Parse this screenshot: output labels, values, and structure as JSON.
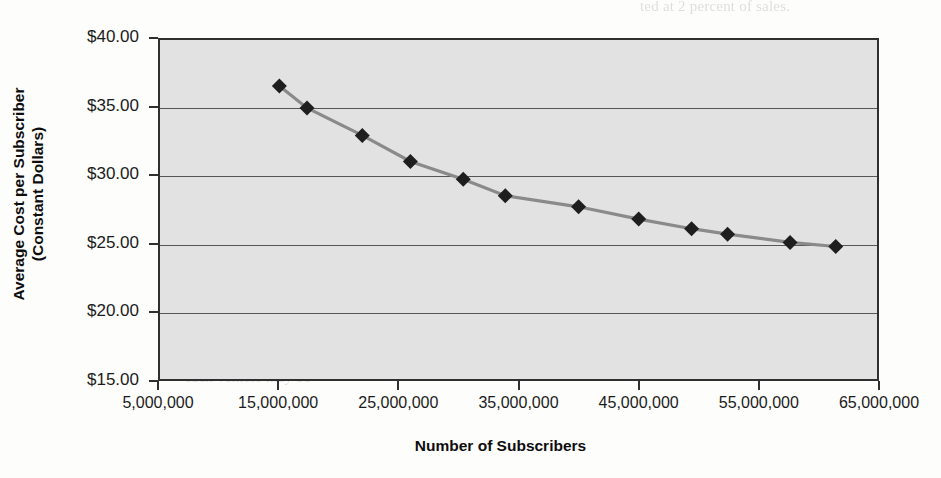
{
  "chart_data": {
    "type": "line",
    "title": "",
    "xlabel": "Number of Subscribers",
    "ylabel": "Average Cost per Subscriber (Constant Dollars)",
    "ylabel_line1": "Average Cost per Subscriber",
    "ylabel_line2": "(Constant Dollars)",
    "xlim": [
      5000000,
      65000000
    ],
    "ylim": [
      15,
      40
    ],
    "grid": true,
    "legend": "none",
    "marker": "diamond",
    "line_color": "#8a8a8a",
    "marker_color": "#1e1e1e",
    "plot_background": "#e2e2e2",
    "ytick_labels": [
      "$40.00",
      "$35.00",
      "$30.00",
      "$25.00",
      "$20.00",
      "$15.00"
    ],
    "ytick_values": [
      40,
      35,
      30,
      25,
      20,
      15
    ],
    "xtick_labels": [
      "5,000,000",
      "15,000,000",
      "25,000,000",
      "35,000,000",
      "45,000,000",
      "55,000,000",
      "65,000,000"
    ],
    "xtick_values": [
      5000000,
      15000000,
      25000000,
      35000000,
      45000000,
      55000000,
      65000000
    ],
    "x": [
      15100000,
      17400000,
      22000000,
      26000000,
      30400000,
      33900000,
      40000000,
      45000000,
      49400000,
      52400000,
      57600000,
      61400000
    ],
    "y": [
      36.5,
      34.9,
      32.9,
      31.0,
      29.7,
      28.5,
      27.7,
      26.8,
      26.1,
      25.7,
      25.1,
      24.8
    ],
    "series": [
      {
        "name": "Average Cost per Subscriber",
        "points": [
          {
            "x": 15100000,
            "y": 36.5
          },
          {
            "x": 17400000,
            "y": 34.9
          },
          {
            "x": 22000000,
            "y": 32.9
          },
          {
            "x": 26000000,
            "y": 31.0
          },
          {
            "x": 30400000,
            "y": 29.7
          },
          {
            "x": 33900000,
            "y": 28.5
          },
          {
            "x": 40000000,
            "y": 27.7
          },
          {
            "x": 45000000,
            "y": 26.8
          },
          {
            "x": 49400000,
            "y": 26.1
          },
          {
            "x": 52400000,
            "y": 25.7
          },
          {
            "x": 57600000,
            "y": 25.1
          },
          {
            "x": 61400000,
            "y": 24.8
          }
        ]
      }
    ]
  },
  "page_bleed": {
    "lines": [
      "ted at 2 percent of sales.",
      "of programming costs, the figures in",
      "all the figures in",
      "Cost Curve",
      "ing to revenue. The",
      "own plant net sales",
      "cost of capital for",
      "manufacturing firm",
      "to its own produc-",
      "additional products,",
      "it may be",
      "each vehicle may be"
    ]
  }
}
